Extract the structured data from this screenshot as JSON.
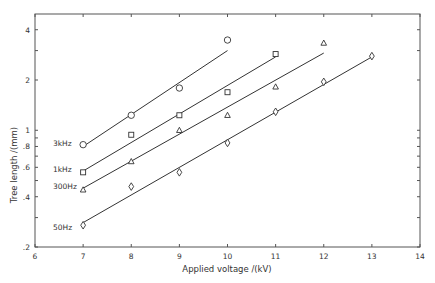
{
  "chart_data": {
    "type": "scatter",
    "title": "",
    "xlabel": "Applied voltage /(kV)",
    "ylabel": "Tree length /(mm)",
    "xlim": [
      6,
      14
    ],
    "ylim": [
      0.2,
      4.5
    ],
    "yscale": "log",
    "grid": false,
    "legend_position": "inline labels left of series",
    "x_ticks": [
      6,
      7,
      8,
      9,
      10,
      11,
      12,
      13,
      14
    ],
    "y_ticks": [
      0.2,
      0.4,
      0.6,
      0.8,
      1,
      2,
      4
    ],
    "y_tick_labels": [
      ".2",
      ".4",
      ".6",
      ".8",
      "1",
      "2",
      "4"
    ],
    "series": [
      {
        "name": "3kHz",
        "marker": "circle",
        "x": [
          7,
          8,
          9,
          10
        ],
        "values": [
          0.82,
          1.23,
          1.79,
          3.47
        ],
        "fit_line": {
          "from": [
            7,
            0.8
          ],
          "to": [
            10,
            3.0
          ]
        }
      },
      {
        "name": "1kHz",
        "marker": "square",
        "x": [
          7,
          8,
          9,
          10,
          11
        ],
        "values": [
          0.56,
          0.94,
          1.23,
          1.69,
          2.86
        ],
        "fit_line": {
          "from": [
            7,
            0.57
          ],
          "to": [
            11,
            2.75
          ]
        }
      },
      {
        "name": "300Hz",
        "marker": "triangle",
        "x": [
          7,
          8,
          9,
          10,
          11,
          12
        ],
        "values": [
          0.44,
          0.65,
          1.0,
          1.23,
          1.82,
          3.33
        ],
        "fit_line": {
          "from": [
            7,
            0.45
          ],
          "to": [
            12,
            2.9
          ]
        }
      },
      {
        "name": "50Hz",
        "marker": "diamond",
        "x": [
          7,
          8,
          9,
          10,
          11,
          12,
          13
        ],
        "values": [
          0.27,
          0.46,
          0.56,
          0.84,
          1.29,
          1.95,
          2.78
        ],
        "fit_line": {
          "from": [
            7,
            0.28
          ],
          "to": [
            13,
            2.75
          ]
        }
      }
    ]
  }
}
